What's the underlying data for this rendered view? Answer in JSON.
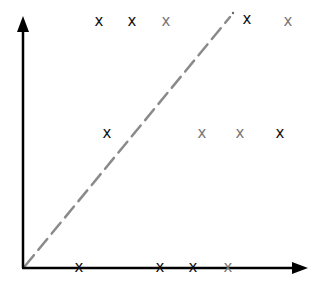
{
  "diagram": {
    "axes": {
      "origin": [
        23,
        268
      ],
      "y_axis_top": [
        23,
        16
      ],
      "x_axis_right": [
        308,
        268
      ],
      "color": "#000000"
    },
    "diagonal": {
      "from": [
        25,
        266
      ],
      "to": [
        232,
        14
      ],
      "style": "dashed",
      "color": "#888888"
    },
    "marker_glyph": "x",
    "markers": [
      {
        "x": 99,
        "y": 22,
        "tone": "dark",
        "glyph": "x"
      },
      {
        "x": 132,
        "y": 22,
        "tone": "dark",
        "glyph": "x"
      },
      {
        "x": 166,
        "y": 22,
        "tone": "gray",
        "glyph": "x"
      },
      {
        "x": 247,
        "y": 20,
        "tone": "dark",
        "glyph": "x"
      },
      {
        "x": 288,
        "y": 22,
        "tone": "gray",
        "glyph": "x"
      },
      {
        "x": 107,
        "y": 134,
        "tone": "dark",
        "glyph": "x"
      },
      {
        "x": 202,
        "y": 134,
        "tone": "gray",
        "glyph": "x"
      },
      {
        "x": 240,
        "y": 134,
        "tone": "gray",
        "glyph": "x"
      },
      {
        "x": 280,
        "y": 134,
        "tone": "dark",
        "glyph": "x"
      },
      {
        "x": 79,
        "y": 268,
        "tone": "dark",
        "glyph": "x"
      },
      {
        "x": 160,
        "y": 268,
        "tone": "dark",
        "glyph": "x"
      },
      {
        "x": 193,
        "y": 268,
        "tone": "dark",
        "glyph": "x"
      },
      {
        "x": 228,
        "y": 268,
        "tone": "gray",
        "glyph": "x"
      }
    ],
    "colors": {
      "dark": "#111111",
      "gray": "#777777"
    }
  }
}
